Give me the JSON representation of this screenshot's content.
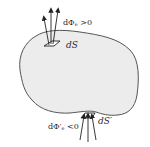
{
  "diagram": {
    "surface": {
      "fill": "#ececec",
      "stroke": "#555555"
    },
    "patch_top": {
      "label": "dS",
      "flux_label_prefix": "dΦ",
      "flux_subscript": "e",
      "flux_condition": " >0"
    },
    "patch_bottom": {
      "label": "dS′",
      "flux_label_prefix": "dΦ′",
      "flux_subscript": "e",
      "flux_condition": " <0"
    }
  }
}
